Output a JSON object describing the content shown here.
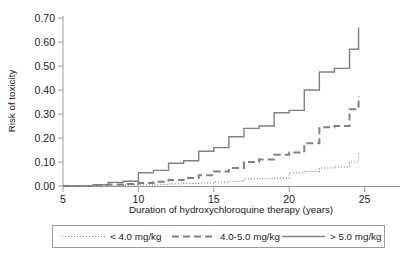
{
  "chart_data": {
    "type": "line",
    "title": "",
    "subtitle": "",
    "xlabel": "Duration of hydroxychloroquine therapy (years)",
    "ylabel": "Risk of toxicity",
    "xlim": [
      5,
      27.5
    ],
    "ylim": [
      0.0,
      0.7
    ],
    "xticks": [
      5,
      10,
      15,
      20,
      25
    ],
    "xtick_labels": [
      "5",
      "10",
      "15",
      "20",
      "25"
    ],
    "yticks": [
      0.0,
      0.1,
      0.2,
      0.3,
      0.4,
      0.5,
      0.6,
      0.7
    ],
    "ytick_labels": [
      "0.00",
      "0.10",
      "0.20",
      "0.30",
      "0.40",
      "0.50",
      "0.60",
      "0.70"
    ],
    "grid": false,
    "legend_position": "below",
    "step_shape": "post",
    "line_color": "#808080",
    "axis_color": "#9a9a9a",
    "series": [
      {
        "name": "< 4.0 mg/kg",
        "style": "dotted",
        "dash": "1,2",
        "width": 1.2,
        "x": [
          5,
          6,
          7,
          8,
          9,
          10,
          11,
          12,
          13,
          14,
          15,
          16,
          17,
          18,
          19,
          20,
          21,
          22,
          23,
          24,
          24.6
        ],
        "y": [
          0.0,
          0.0,
          0.0,
          0.002,
          0.004,
          0.005,
          0.007,
          0.009,
          0.011,
          0.013,
          0.016,
          0.019,
          0.03,
          0.031,
          0.033,
          0.055,
          0.06,
          0.075,
          0.08,
          0.1,
          0.14
        ]
      },
      {
        "name": "4.0-5.0 mg/kg",
        "style": "dashed",
        "dash": "7,4",
        "width": 2.0,
        "x": [
          5,
          6,
          7,
          8,
          9,
          10,
          11,
          12,
          13,
          14,
          15,
          16,
          17,
          18,
          19,
          20,
          21,
          22,
          23,
          24,
          24.6
        ],
        "y": [
          0.0,
          0.0,
          0.004,
          0.006,
          0.008,
          0.012,
          0.018,
          0.025,
          0.033,
          0.045,
          0.06,
          0.075,
          0.1,
          0.11,
          0.13,
          0.14,
          0.178,
          0.245,
          0.25,
          0.32,
          0.375
        ]
      },
      {
        "name": "> 5.0 mg/kg",
        "style": "solid",
        "dash": "none",
        "width": 1.4,
        "x": [
          5,
          6,
          7,
          8,
          9,
          10,
          11,
          12,
          13,
          14,
          15,
          16,
          17,
          18,
          19,
          20,
          21,
          22,
          23,
          24,
          24.6
        ],
        "y": [
          0.0,
          0.0,
          0.005,
          0.015,
          0.02,
          0.055,
          0.065,
          0.095,
          0.105,
          0.145,
          0.16,
          0.205,
          0.24,
          0.25,
          0.305,
          0.315,
          0.4,
          0.475,
          0.49,
          0.57,
          0.66
        ]
      }
    ]
  },
  "legend": {
    "items": [
      {
        "label": "< 4.0 mg/kg",
        "style": "dotted"
      },
      {
        "label": "4.0-5.0 mg/kg",
        "style": "dashed"
      },
      {
        "label": "> 5.0 mg/kg",
        "style": "solid"
      }
    ]
  }
}
